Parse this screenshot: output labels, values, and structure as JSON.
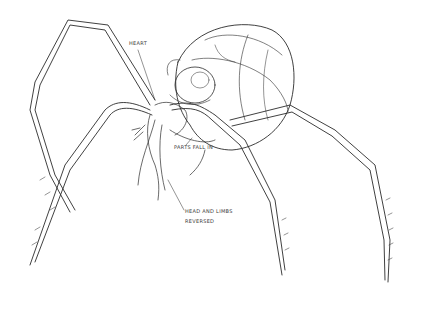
{
  "illustration": {
    "subject": "pencil sketch of spider-like creature",
    "background": "#ffffff",
    "line_color": "#2b2b2b"
  },
  "annotations": [
    {
      "id": "heart",
      "text": "HEART",
      "x": 129,
      "y": 44
    },
    {
      "id": "mouth-parts",
      "text": "PARTS FALL IN",
      "x": 174,
      "y": 147
    },
    {
      "id": "head-limbs-line1",
      "text": "HEAD AND LIMBS",
      "x": 185,
      "y": 210
    },
    {
      "id": "head-limbs-line2",
      "text": "REVERSED",
      "x": 185,
      "y": 220
    }
  ]
}
